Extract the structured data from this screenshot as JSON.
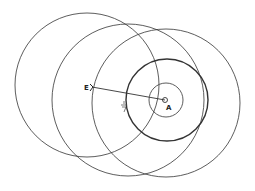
{
  "diagram": {
    "stroke_color": "#333333",
    "background": "#ffffff",
    "circles": [
      {
        "name": "circle-left-large",
        "cx": 87,
        "cy": 85,
        "r": 72,
        "width": 0.8
      },
      {
        "name": "circle-middle-large",
        "cx": 128,
        "cy": 100,
        "r": 76,
        "width": 0.8
      },
      {
        "name": "circle-right-large",
        "cx": 166,
        "cy": 103,
        "r": 74,
        "width": 0.8
      },
      {
        "name": "circle-medium-thick",
        "cx": 167,
        "cy": 100,
        "r": 41,
        "width": 1.4
      },
      {
        "name": "circle-small",
        "cx": 166,
        "cy": 100,
        "r": 17,
        "width": 0.8
      },
      {
        "name": "circle-point-a",
        "cx": 165,
        "cy": 100,
        "r": 2.5,
        "width": 0.9
      }
    ],
    "segment": {
      "x1": 92,
      "y1": 87,
      "x2": 165,
      "y2": 100
    },
    "labels": {
      "e": {
        "text": "E",
        "x": 84,
        "y": 90
      },
      "a": {
        "text": "A",
        "x": 166,
        "y": 110
      },
      "mark": {
        "text": "F",
        "x": 122,
        "y": 108
      }
    }
  }
}
